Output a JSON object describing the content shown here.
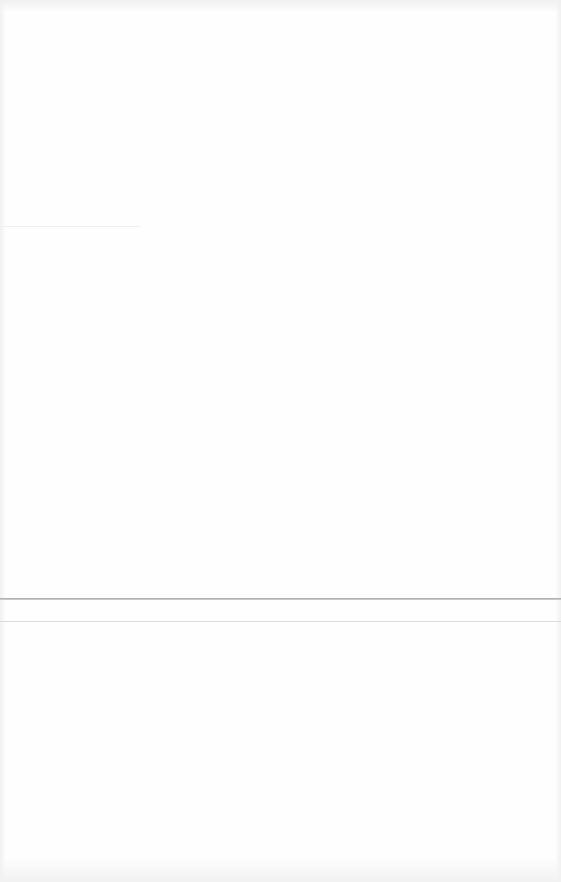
{
  "page": {
    "background_color": "#fefefe",
    "rules": [
      {
        "position_y": 599,
        "color": "#a6a6a6"
      },
      {
        "position_y": 622,
        "color": "#dcdcdc"
      }
    ]
  }
}
